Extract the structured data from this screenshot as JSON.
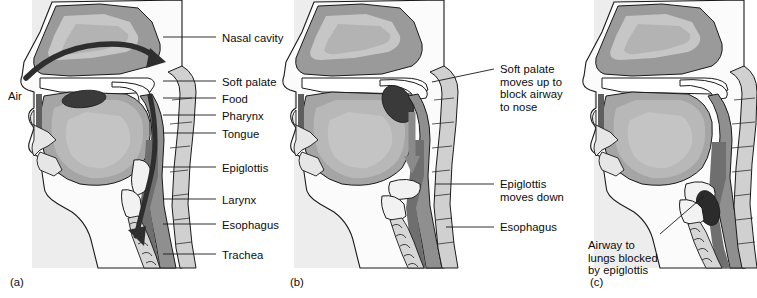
{
  "figure": {
    "colors": {
      "background": "#ffffff",
      "panel_tint": "#ededed",
      "outline": "#1a1a1a",
      "tissue_light": "#e2e2e2",
      "tissue_mid": "#b9b9b9",
      "tissue_dark": "#8f8f8f",
      "tissue_darker": "#6f6f6f",
      "bolus_dark": "#3a3a3a",
      "arrow_dark": "#404040",
      "arrow_gray": "#8a8a8a",
      "leader_line": "#1a1a1a",
      "text": "#0b0b0b"
    }
  },
  "panels": [
    {
      "id": "a",
      "letter": "(a)",
      "air_label": "Air",
      "labels": [
        {
          "text": "Nasal cavity",
          "x": 222,
          "y": 32,
          "leader_x1": 163,
          "leader_y1": 37,
          "leader_x2": 216,
          "leader_y2": 37
        },
        {
          "text": "Soft palate",
          "x": 222,
          "y": 76,
          "leader_x1": 163,
          "leader_y1": 81,
          "leader_x2": 216,
          "leader_y2": 81
        },
        {
          "text": "Food",
          "x": 222,
          "y": 93,
          "leader_x1": 163,
          "leader_y1": 98,
          "leader_x2": 216,
          "leader_y2": 98
        },
        {
          "text": "Pharynx",
          "x": 222,
          "y": 110,
          "leader_x1": 163,
          "leader_y1": 115,
          "leader_x2": 216,
          "leader_y2": 115
        },
        {
          "text": "Tongue",
          "x": 222,
          "y": 128,
          "leader_x1": 163,
          "leader_y1": 133,
          "leader_x2": 216,
          "leader_y2": 133
        },
        {
          "text": "Epiglottis",
          "x": 222,
          "y": 162,
          "leader_x1": 163,
          "leader_y1": 167,
          "leader_x2": 216,
          "leader_y2": 167
        },
        {
          "text": "Larynx",
          "x": 222,
          "y": 194,
          "leader_x1": 163,
          "leader_y1": 199,
          "leader_x2": 216,
          "leader_y2": 199
        },
        {
          "text": "Esophagus",
          "x": 222,
          "y": 219,
          "leader_x1": 163,
          "leader_y1": 224,
          "leader_x2": 216,
          "leader_y2": 224
        },
        {
          "text": "Trachea",
          "x": 222,
          "y": 249,
          "leader_x1": 163,
          "leader_y1": 254,
          "leader_x2": 216,
          "leader_y2": 254
        }
      ]
    },
    {
      "id": "b",
      "letter": "(b)",
      "labels": [
        {
          "text": "Soft palate\nmoves up to\nblock airway\nto nose",
          "x": 500,
          "y": 63,
          "leader_x1": 432,
          "leader_y1": 82,
          "leader_x2": 494,
          "leader_y2": 69
        },
        {
          "text": "Epiglottis\nmoves down",
          "x": 500,
          "y": 178,
          "leader_x1": 435,
          "leader_y1": 184,
          "leader_x2": 494,
          "leader_y2": 184
        },
        {
          "text": "Esophagus",
          "x": 500,
          "y": 221,
          "leader_x1": 446,
          "leader_y1": 227,
          "leader_x2": 494,
          "leader_y2": 227
        }
      ]
    },
    {
      "id": "c",
      "letter": "(c)",
      "labels": [
        {
          "text": "Airway to\nlungs blocked\nby epiglottis",
          "x": 588,
          "y": 239,
          "leader_x1": 660,
          "leader_y1": 234,
          "leader_x2": 704,
          "leader_y2": 196
        }
      ]
    }
  ]
}
